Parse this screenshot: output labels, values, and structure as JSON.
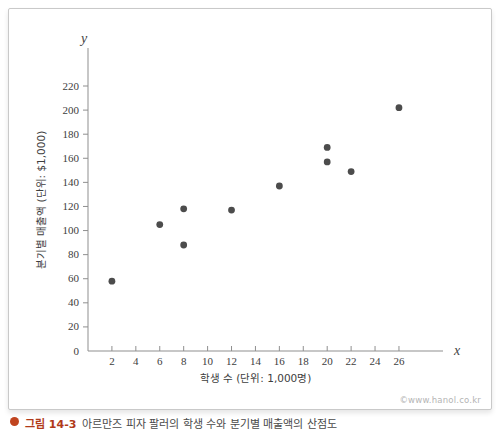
{
  "watermark": "©www.hanol.co.kr",
  "caption": {
    "label": "그림 14-3",
    "text": "아르만즈 피자 팔러의 학생 수와 분기별 매출액의 산점도"
  },
  "chart_data": {
    "type": "scatter",
    "title": "",
    "xlabel": "학생 수 (단위: 1,000명)",
    "ylabel": "분기별 매출액 (단위: $1,000)",
    "x_axis_letter": "x",
    "y_axis_letter": "y",
    "x_ticks": [
      2,
      4,
      6,
      8,
      10,
      12,
      14,
      16,
      18,
      20,
      22,
      24,
      26
    ],
    "y_ticks": [
      0,
      20,
      40,
      60,
      80,
      100,
      120,
      140,
      160,
      180,
      200,
      220
    ],
    "xlim": [
      0,
      29.7
    ],
    "ylim": [
      0,
      251
    ],
    "grid": false,
    "legend": null,
    "points": [
      {
        "x": 2,
        "y": 58
      },
      {
        "x": 6,
        "y": 105
      },
      {
        "x": 8,
        "y": 88
      },
      {
        "x": 8,
        "y": 118
      },
      {
        "x": 12,
        "y": 117
      },
      {
        "x": 16,
        "y": 137
      },
      {
        "x": 20,
        "y": 157
      },
      {
        "x": 20,
        "y": 169
      },
      {
        "x": 22,
        "y": 149
      },
      {
        "x": 26,
        "y": 202
      }
    ],
    "point_color": "#4c4c4c",
    "axis_color": "#8f8f8f"
  }
}
